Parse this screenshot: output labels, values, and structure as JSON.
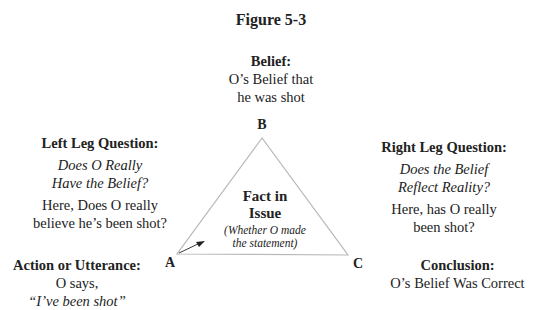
{
  "figure": {
    "title": "Figure 5-3"
  },
  "top": {
    "heading": "Belief:",
    "lines": [
      "O’s Belief that",
      "he was shot"
    ]
  },
  "left_leg": {
    "heading": "Left Leg Question:",
    "italic_lines": [
      "Does O Really",
      "Have the Belief?"
    ],
    "lines": [
      "Here, Does O really",
      "believe he’s been shot?"
    ]
  },
  "right_leg": {
    "heading": "Right Leg Question:",
    "italic_lines": [
      "Does the Belief",
      "Reflect Reality?"
    ],
    "lines": [
      "Here, has O really",
      "been shot?"
    ]
  },
  "bottom_left": {
    "heading": "Action or Utterance:",
    "line": "O says,",
    "italic_line": "“I’ve been shot”"
  },
  "bottom_right": {
    "heading": "Conclusion:",
    "line": "O’s Belief Was Correct"
  },
  "vertices": {
    "a": "A",
    "b": "B",
    "c": "C"
  },
  "center": {
    "lines": [
      "Fact in",
      "Issue"
    ],
    "sub_lines": [
      "(Whether O made",
      "the statement)"
    ]
  },
  "colors": {
    "text": "#222222",
    "triangle_stroke": "#b8b8b8",
    "arrow": "#222222"
  }
}
